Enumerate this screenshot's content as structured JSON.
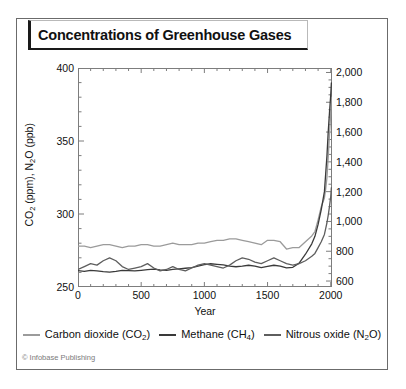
{
  "title": "Concentrations of Greenhouse Gases",
  "credit": "© Infobase Publishing",
  "colors": {
    "co2": "#9b9b9b",
    "ch4": "#3a3a3a",
    "n2o": "#5e5e5e",
    "frame": "#7d7d7d",
    "text": "#111111"
  },
  "axes": {
    "left": {
      "label_parts": {
        "pre": "CO",
        "sub1": "2",
        "mid": " (ppm), N",
        "sub2": "2",
        "post": "O (ppb)"
      },
      "label_plain": "CO2 (ppm), N2O (ppb)",
      "ticks": [
        "250",
        "300",
        "350",
        "400"
      ],
      "tick_values": [
        250,
        300,
        350,
        400
      ],
      "range": [
        250,
        400
      ],
      "minor_step": 10
    },
    "right": {
      "label_plain": "CH4 (ppb)",
      "ticks": [
        "600",
        "800",
        "1,000",
        "1,200",
        "1,400",
        "1,600",
        "1,800",
        "2,000"
      ],
      "tick_values": [
        600,
        800,
        1000,
        1200,
        1400,
        1600,
        1800,
        2000
      ],
      "range": [
        560,
        2030
      ],
      "minor_step": 50
    },
    "bottom": {
      "label": "Year",
      "ticks": [
        "0",
        "500",
        "1000",
        "1500",
        "2000"
      ],
      "tick_values": [
        0,
        500,
        1000,
        1500,
        2000
      ],
      "range": [
        0,
        2010
      ],
      "minor_step": 100
    }
  },
  "legend": {
    "position": "below-axis",
    "items": [
      {
        "label_pre": "Carbon dioxide (CO",
        "label_sub": "2",
        "label_post": ")",
        "label_plain": "Carbon dioxide (CO2)",
        "color": "#9b9b9b"
      },
      {
        "label_pre": "Methane (CH",
        "label_sub": "4",
        "label_post": ")",
        "label_plain": "Methane (CH4)",
        "color": "#3a3a3a"
      },
      {
        "label_pre": "Nitrous oxide (N",
        "label_sub": "2",
        "label_post": "O)",
        "label_plain": "Nitrous oxide (N2O)",
        "color": "#5e5e5e"
      }
    ]
  },
  "chart_data": {
    "type": "line",
    "title": "Concentrations of Greenhouse Gases",
    "xlabel": "Year",
    "ylabel": "CO2 (ppm), N2O (ppb)",
    "ylabel_right": "CH4 (ppb)",
    "xlim": [
      0,
      2010
    ],
    "ylim": [
      250,
      400
    ],
    "ylim_right": [
      560,
      2030
    ],
    "grid": false,
    "legend_position": "bottom",
    "series": [
      {
        "name": "Carbon dioxide (CO2)",
        "axis": "left",
        "unit": "ppm",
        "color": "#9b9b9b",
        "x": [
          0,
          50,
          100,
          150,
          200,
          250,
          300,
          350,
          400,
          450,
          500,
          550,
          600,
          650,
          700,
          750,
          800,
          850,
          900,
          950,
          1000,
          1050,
          1100,
          1150,
          1200,
          1250,
          1300,
          1350,
          1400,
          1450,
          1500,
          1550,
          1600,
          1650,
          1700,
          1750,
          1800,
          1850,
          1875,
          1900,
          1925,
          1950,
          1960,
          1970,
          1980,
          1990,
          2000,
          2005
        ],
        "y": [
          278,
          278,
          277,
          278,
          279,
          279,
          278,
          277,
          278,
          278,
          279,
          279,
          278,
          278,
          279,
          280,
          279,
          279,
          279,
          280,
          280,
          281,
          282,
          282,
          283,
          283,
          282,
          281,
          280,
          279,
          282,
          282,
          281,
          276,
          277,
          277,
          281,
          285,
          288,
          296,
          305,
          311,
          317,
          325,
          339,
          354,
          369,
          380
        ]
      },
      {
        "name": "Methane (CH4)",
        "axis": "right",
        "unit": "ppb",
        "color": "#3a3a3a",
        "x": [
          0,
          50,
          100,
          150,
          200,
          250,
          300,
          350,
          400,
          450,
          500,
          550,
          600,
          650,
          700,
          750,
          800,
          850,
          900,
          950,
          1000,
          1050,
          1100,
          1150,
          1200,
          1250,
          1300,
          1350,
          1400,
          1450,
          1500,
          1550,
          1600,
          1650,
          1700,
          1750,
          1800,
          1850,
          1875,
          1900,
          1925,
          1950,
          1960,
          1970,
          1980,
          1990,
          2000,
          2005
        ],
        "y": [
          670,
          665,
          672,
          668,
          663,
          660,
          665,
          672,
          670,
          668,
          672,
          676,
          680,
          675,
          672,
          678,
          682,
          686,
          690,
          700,
          710,
          716,
          712,
          708,
          700,
          696,
          700,
          706,
          700,
          690,
          698,
          706,
          700,
          688,
          692,
          720,
          780,
          850,
          900,
          980,
          1080,
          1200,
          1320,
          1440,
          1600,
          1730,
          1850,
          1930
        ]
      },
      {
        "name": "Nitrous oxide (N2O)",
        "axis": "left",
        "unit": "ppb",
        "color": "#5e5e5e",
        "x": [
          0,
          50,
          100,
          150,
          200,
          250,
          300,
          350,
          400,
          450,
          500,
          550,
          600,
          650,
          700,
          750,
          800,
          850,
          900,
          950,
          1000,
          1050,
          1100,
          1150,
          1200,
          1250,
          1300,
          1350,
          1400,
          1450,
          1500,
          1550,
          1600,
          1650,
          1700,
          1750,
          1800,
          1850,
          1875,
          1900,
          1925,
          1950,
          1960,
          1970,
          1980,
          1990,
          2000,
          2005
        ],
        "y": [
          262,
          264,
          266,
          265,
          268,
          270,
          268,
          264,
          262,
          263,
          264,
          266,
          263,
          261,
          262,
          264,
          262,
          261,
          263,
          265,
          266,
          265,
          264,
          263,
          265,
          268,
          270,
          269,
          267,
          266,
          268,
          270,
          268,
          266,
          265,
          266,
          268,
          271,
          273,
          277,
          281,
          286,
          290,
          294,
          299,
          305,
          312,
          318
        ]
      }
    ]
  }
}
